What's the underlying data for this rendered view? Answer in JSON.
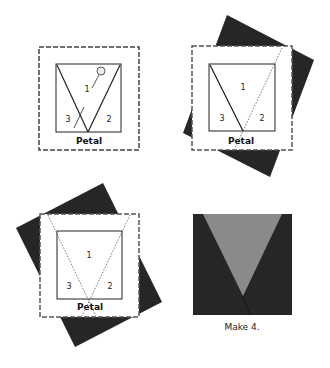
{
  "colors": {
    "dark_fabric": "#262626",
    "gray_fabric": "#8a8a8a",
    "paper": "#ffffff",
    "line": "#222222",
    "dashed_border": "#666666"
  },
  "panels": [
    {
      "id": "step-1",
      "section_labels": [
        "1",
        "2",
        "3"
      ],
      "pattern_label": "Petal",
      "has_pin": true
    },
    {
      "id": "step-2",
      "section_labels": [
        "1",
        "2",
        "3"
      ],
      "pattern_label": "Petal"
    },
    {
      "id": "step-3",
      "section_labels": [
        "1",
        "2",
        "3"
      ],
      "pattern_label": "Petal"
    },
    {
      "id": "step-4-finished",
      "caption": "Make 4."
    }
  ]
}
